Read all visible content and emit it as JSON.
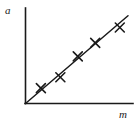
{
  "chart_data": {
    "type": "scatter",
    "title": "",
    "subtitle": "",
    "xlabel": "m",
    "ylabel": "a",
    "grid": false,
    "legend": null,
    "xlim": [
      0,
      10
    ],
    "ylim": [
      0,
      10
    ],
    "axis_ticks": {
      "x": [],
      "y": []
    },
    "marker": "x",
    "marker_color": "#1a1a1a",
    "line_color": "#1a1a1a",
    "series": [
      {
        "name": "measurements",
        "marker": "x",
        "points": [
          {
            "x": 1.5,
            "y": 1.7
          },
          {
            "x": 3.4,
            "y": 2.9
          },
          {
            "x": 5.1,
            "y": 5.2
          },
          {
            "x": 6.8,
            "y": 6.7
          },
          {
            "x": 9.2,
            "y": 8.4
          }
        ]
      }
    ],
    "fit_line": {
      "name": "best-fit line",
      "through_origin": true,
      "x_start": 0,
      "y_start": 0,
      "x_end": 10,
      "y_end": 9.7,
      "slope": 0.97,
      "intercept": 0
    },
    "annotations": []
  },
  "figure": {
    "background_color": "#ffffff",
    "axis_color": "#1a1a1a",
    "ylabel_text": "a",
    "xlabel_text": "m"
  }
}
